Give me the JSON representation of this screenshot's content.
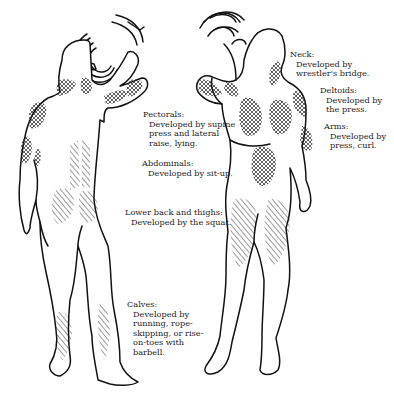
{
  "figures": {
    "back_view": {
      "label": "back-view-figure"
    },
    "front_view": {
      "label": "front-view-figure"
    }
  },
  "labels": {
    "neck": {
      "title": "Neck:",
      "lines": [
        "Developed by",
        "wrestler's bridge."
      ]
    },
    "deltoids": {
      "title": "Deltoids:",
      "lines": [
        "Developed by",
        "the press."
      ]
    },
    "arms": {
      "title": "Arms:",
      "lines": [
        "Developed by",
        "press, curl."
      ]
    },
    "pectorals": {
      "title": "Pectorals:",
      "lines": [
        "Developed by supine",
        "press and lateral",
        "raise, lying."
      ]
    },
    "abdominals": {
      "title": "Abdominals:",
      "lines": [
        "Developed by sit-up."
      ]
    },
    "lower_back_thighs": {
      "title": "Lower back and thighs:",
      "lines": [
        "Developed by the squat."
      ]
    },
    "calves": {
      "title": "Calves:",
      "lines": [
        "Developed by",
        "running, rope-",
        "skipping, or rise-",
        "on-toes with",
        "barbell."
      ]
    }
  },
  "legend": {
    "crosshatch": "upper-body muscle groups",
    "diagonal_hatch": "lower-body muscle groups"
  },
  "colors": {
    "ink": "#111111",
    "paper": "#ffffff"
  }
}
